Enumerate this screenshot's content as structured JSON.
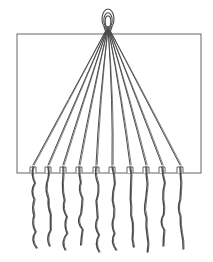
{
  "diagram": {
    "style": "hand-drawn line illustration",
    "stroke_color": "#4a4a4a",
    "background_color": "#ffffff",
    "card": {
      "x": 17,
      "y": 34,
      "width": 184,
      "height": 139
    },
    "knot": {
      "cx": 108,
      "cy": 19,
      "rx": 6,
      "ry": 10
    },
    "convergence_point": {
      "x": 108,
      "y": 30
    },
    "notch_count": 10,
    "notches_x": [
      33,
      48,
      63,
      79,
      96,
      112,
      130,
      146,
      162,
      180
    ],
    "thread_end_y": [
      248,
      246,
      250,
      245,
      252,
      250,
      247,
      252,
      246,
      249
    ]
  }
}
